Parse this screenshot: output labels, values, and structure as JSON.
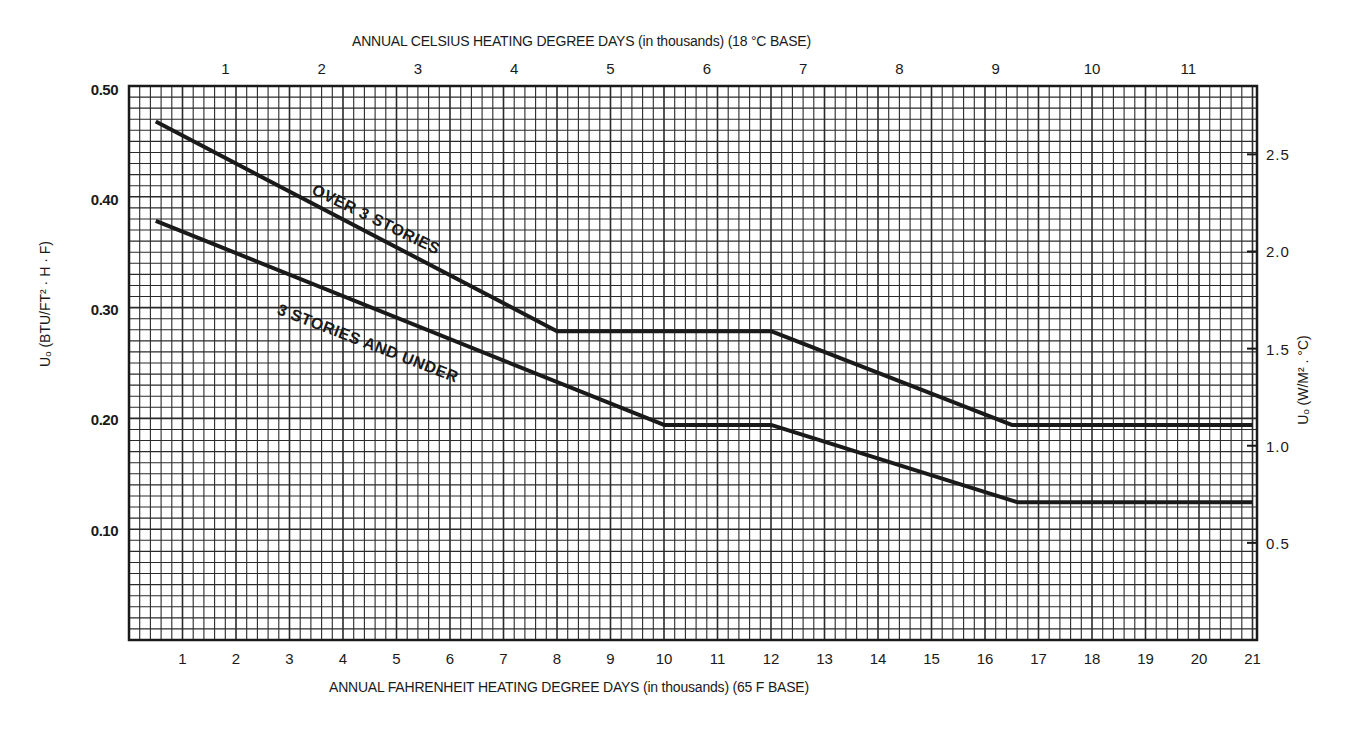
{
  "chart_data": {
    "type": "line",
    "title": "",
    "top_axis": {
      "label": "ANNUAL CELSIUS HEATING DEGREE DAYS (in thousands) (18 °C BASE)",
      "ticks": [
        "1",
        "2",
        "3",
        "4",
        "5",
        "6",
        "7",
        "8",
        "9",
        "10",
        "11"
      ]
    },
    "xlabel": "ANNUAL FAHRENHEIT HEATING DEGREE DAYS (in thousands) (65 F BASE)",
    "x_ticks": [
      "1",
      "2",
      "3",
      "4",
      "5",
      "6",
      "7",
      "8",
      "9",
      "10",
      "11",
      "12",
      "13",
      "14",
      "15",
      "16",
      "17",
      "18",
      "19",
      "20",
      "21"
    ],
    "xlim": [
      0,
      21
    ],
    "ylabel": "Uₒ (BTU/FT² · H · F)",
    "y_ticks": [
      "0.50",
      "0.40",
      "0.30",
      "0.20",
      "0.10"
    ],
    "ylim": [
      0,
      0.5
    ],
    "right_axis": {
      "label": "Uₒ (W/M² . °C)",
      "ticks": [
        "2.5",
        "2.0",
        "1.5",
        "1.0",
        "0.5"
      ]
    },
    "grid": true,
    "series": [
      {
        "name": "OVER 3 STORIES",
        "x": [
          0.5,
          8,
          12,
          16.5,
          21
        ],
        "y": [
          0.47,
          0.28,
          0.28,
          0.195,
          0.195
        ]
      },
      {
        "name": "3 STORIES AND UNDER",
        "x": [
          0.5,
          10,
          12,
          16.6,
          21
        ],
        "y": [
          0.38,
          0.195,
          0.195,
          0.125,
          0.125
        ]
      }
    ]
  },
  "colors": {
    "ink": "#1a1a1a",
    "grid": "#2a2a2a",
    "paper": "#ffffff"
  }
}
